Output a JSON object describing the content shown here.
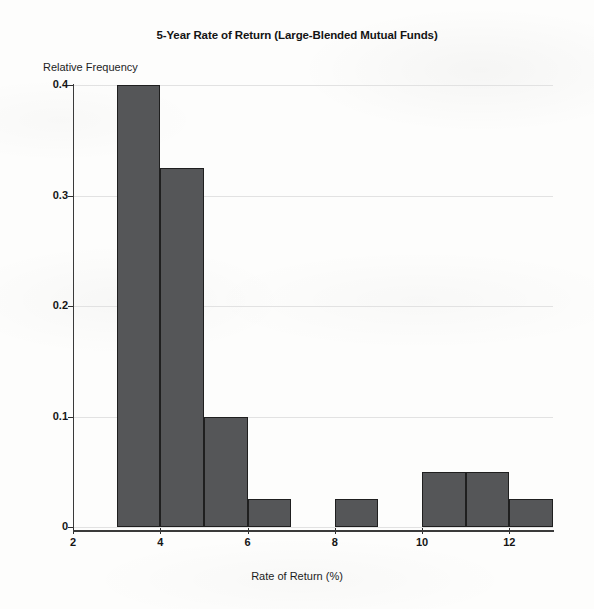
{
  "chart_data": {
    "type": "bar",
    "title": "5-Year Rate of Return (Large-Blended Mutual Funds)",
    "xlabel": "Rate of Return (%)",
    "ylabel": "Relative Frequency",
    "xlim": [
      2,
      13
    ],
    "ylim": [
      0,
      0.4
    ],
    "grid": true,
    "legend": null,
    "bin_width": 1,
    "x_tick_labels": [
      "2",
      "4",
      "6",
      "8",
      "10",
      "12"
    ],
    "x_tick_values": [
      2,
      4,
      6,
      8,
      10,
      12
    ],
    "y_tick_labels": [
      "0.4",
      "0.3",
      "0.2",
      "0.1",
      "0"
    ],
    "y_tick_values": [
      0.4,
      0.3,
      0.2,
      0.1,
      0
    ],
    "categories": [
      "3-4",
      "4-5",
      "5-6",
      "6-7",
      "7-8",
      "8-9",
      "9-10",
      "10-11",
      "11-12",
      "12-13"
    ],
    "bins": [
      {
        "start": 3,
        "end": 4,
        "value": 0.4
      },
      {
        "start": 4,
        "end": 5,
        "value": 0.325
      },
      {
        "start": 5,
        "end": 6,
        "value": 0.1
      },
      {
        "start": 6,
        "end": 7,
        "value": 0.025
      },
      {
        "start": 7,
        "end": 8,
        "value": 0
      },
      {
        "start": 8,
        "end": 9,
        "value": 0.025
      },
      {
        "start": 9,
        "end": 10,
        "value": 0
      },
      {
        "start": 10,
        "end": 11,
        "value": 0.05
      },
      {
        "start": 11,
        "end": 12,
        "value": 0.05
      },
      {
        "start": 12,
        "end": 13,
        "value": 0.025
      }
    ],
    "values": [
      0.4,
      0.325,
      0.1,
      0.025,
      0,
      0.025,
      0,
      0.05,
      0.05,
      0.025
    ],
    "bar_color": "#555658",
    "bar_edge_color": "#1f1f1f",
    "background_color": "#fdfdfc",
    "grid_color": "#e2e2e2",
    "axis_color": "#3a3a3a"
  }
}
